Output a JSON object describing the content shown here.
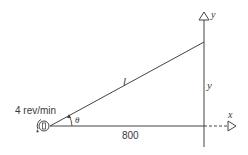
{
  "diagram": {
    "type": "related-rates-geometry",
    "labels": {
      "rotation_rate": "4 rev/min",
      "angle": "θ",
      "hypotenuse": "l",
      "vertical_side": "y",
      "base_distance": "800",
      "x_axis": "x",
      "y_axis": "y"
    },
    "elements": {
      "source": "rotating-light",
      "right_triangle": {
        "vertices": [
          "source",
          "foot-of-vertical-axis",
          "point-on-vertical-axis"
        ],
        "base_length": "800"
      }
    },
    "colors": {
      "line": "#3a3a3a",
      "background": "#ffffff"
    }
  }
}
